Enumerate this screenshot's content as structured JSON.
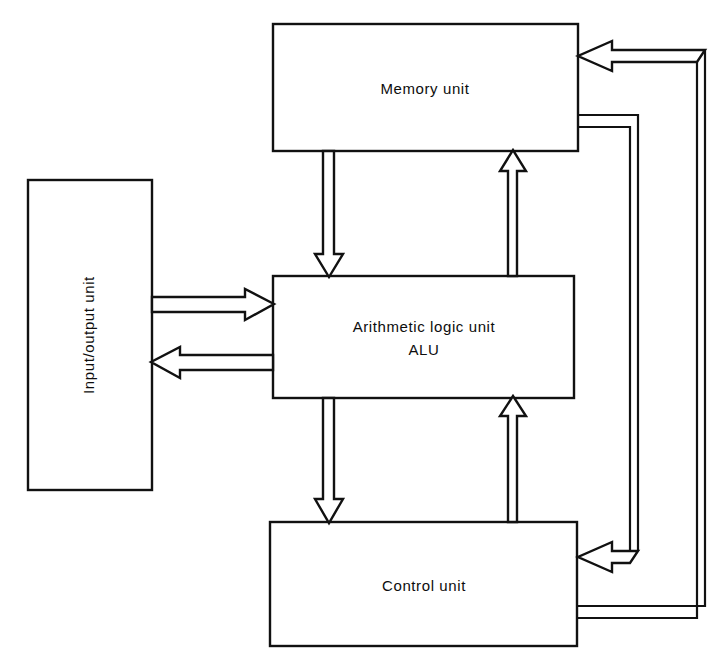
{
  "diagram": {
    "background_color": "#ffffff",
    "line_color": "#111111",
    "text_color": "#0d0d0d",
    "units": {
      "memory": {
        "label": "Memory unit"
      },
      "alu": {
        "label_line1": "Arithmetic logic unit",
        "label_line2": "ALU"
      },
      "control": {
        "label": "Control unit"
      },
      "io": {
        "label": "Input/output unit"
      }
    },
    "connections": {
      "io_to_alu": "Input/output unit to Arithmetic logic unit",
      "alu_to_io": "Arithmetic logic unit to Input/output unit",
      "memory_to_alu": "Memory unit to Arithmetic logic unit",
      "alu_to_memory": "Arithmetic logic unit to Memory unit",
      "alu_to_control": "Arithmetic logic unit to Control unit",
      "control_to_alu": "Control unit to Arithmetic logic unit",
      "control_to_memory": "Control unit to Memory unit",
      "memory_to_control": "Memory unit to Control unit"
    }
  }
}
